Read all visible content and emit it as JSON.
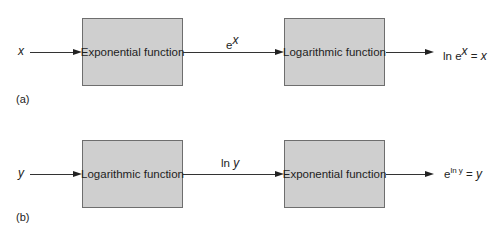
{
  "diagrams": [
    {
      "panel_label": "(a)",
      "input": "x",
      "box1": "Exponential function",
      "middle": {
        "base": "e",
        "sup": "x"
      },
      "box2": "Logarithmic function",
      "output": {
        "prefix": "ln e",
        "sup": "x",
        "suffix": " = ",
        "var": "x"
      }
    },
    {
      "panel_label": "(b)",
      "input": "y",
      "box1": "Logarithmic function",
      "middle": {
        "prefix": "ln ",
        "var": "y"
      },
      "box2": "Exponential function",
      "output": {
        "prefix": "e",
        "sup": "ln y",
        "suffix": " = ",
        "var": "y"
      }
    }
  ],
  "colors": {
    "box_fill": "#cfcfcf",
    "box_border": "#6e6e6e",
    "line": "#333333"
  }
}
